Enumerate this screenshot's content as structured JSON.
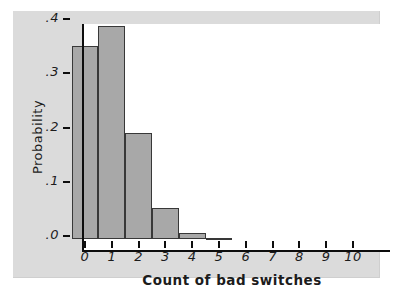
{
  "figure": {
    "page_bg": "#ffffff",
    "panel_bg": "#dbdbdb",
    "plot_bg": "#ffffff",
    "axis_color": "#0d0d0d",
    "text_color": "#1c1c1c"
  },
  "chart_data": {
    "type": "bar",
    "title": "",
    "xlabel": "Count of bad switches",
    "ylabel": "Probability",
    "categories": [
      "0",
      "1",
      "2",
      "3",
      "4",
      "5",
      "6",
      "7",
      "8",
      "9",
      "10"
    ],
    "values": [
      0.355,
      0.39,
      0.195,
      0.056,
      0.011,
      0.002,
      0,
      0,
      0,
      0,
      0
    ],
    "y_ticks": [
      {
        "label": ".0",
        "value": 0.0
      },
      {
        "label": ".1",
        "value": 0.1
      },
      {
        "label": ".2",
        "value": 0.2
      },
      {
        "label": ".3",
        "value": 0.3
      },
      {
        "label": ".4",
        "value": 0.4
      }
    ],
    "ylim": [
      0,
      0.42
    ],
    "grid": false,
    "legend": false,
    "bar_fill": "#a8a8a8",
    "bar_stroke": "#383838"
  }
}
